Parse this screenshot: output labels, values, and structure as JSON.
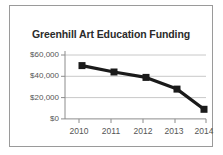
{
  "chart_data": {
    "type": "line",
    "title": "Greenhill Art Education Funding",
    "xlabel": "",
    "ylabel": "",
    "categories": [
      "2010",
      "2011",
      "2012",
      "2013",
      "2014"
    ],
    "values": [
      50000,
      44000,
      39000,
      28000,
      9000
    ],
    "series": [
      {
        "name": "Funding",
        "values": [
          50000,
          44000,
          39000,
          28000,
          9000
        ],
        "color": "#1a1a1a",
        "marker": "square"
      }
    ],
    "ylim": [
      0,
      60000
    ],
    "yticks": [
      0,
      20000,
      40000,
      60000
    ],
    "ytick_labels": [
      "$0",
      "$20,000",
      "$40,000",
      "$60,000"
    ],
    "xtick_labels": [
      "2010",
      "2011",
      "2012",
      "2013",
      "2014"
    ],
    "grid": true,
    "grid_axis": "y",
    "legend": false,
    "legend_position": "none",
    "border": true,
    "colors": {
      "line": "#1a1a1a",
      "marker": "#1a1a1a",
      "grid": "#c8c8c8",
      "axis": "#8c8c8c",
      "frame": "#9a9a9a",
      "title": "#2b2b2b",
      "tick_text": "#555555",
      "background": "#ffffff"
    }
  }
}
